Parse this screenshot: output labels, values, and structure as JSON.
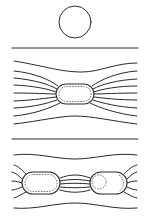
{
  "diagram": {
    "title": "",
    "panels": [
      {
        "id": "top",
        "description": "single circle (isolated cell)",
        "shape": "circle",
        "cx": 75,
        "cy": 22,
        "r": 16
      },
      {
        "id": "middle",
        "description": "single elongated cell with field lines bending around it",
        "cell": {
          "x": 56,
          "y": 84,
          "w": 38,
          "h": 20
        }
      },
      {
        "id": "bottom",
        "description": "two elongated cells with field lines bundled between them",
        "cells": [
          {
            "x": 22,
            "y": 172,
            "w": 38,
            "h": 22
          },
          {
            "x": 90,
            "y": 172,
            "w": 37,
            "h": 22
          }
        ]
      }
    ],
    "dividers": [
      48,
      139
    ],
    "colors": {
      "line": "#2a2a2a",
      "background": "#ffffff"
    }
  }
}
